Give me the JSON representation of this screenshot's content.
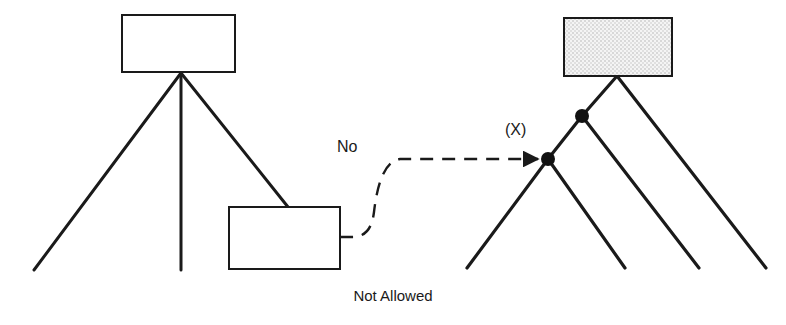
{
  "figure": {
    "caption": "Not Allowed",
    "labels": {
      "rejection": "No",
      "target_node": "(X)"
    },
    "colors": {
      "stroke": "#1a1a1a",
      "box_fill": "#ffffff",
      "stipple_fill": "#f2f2f2",
      "stipple_dot": "#b8b8b8",
      "node_fill": "#111111",
      "background": "#ffffff",
      "text": "#1a1a1a"
    },
    "left_structure": {
      "name": "box-hierarchy-not-allowed",
      "boxes": [
        {
          "id": "top-box",
          "x": 122,
          "y": 15,
          "width": 113,
          "height": 57,
          "fill": "plain"
        },
        {
          "id": "lower-box",
          "x": 229,
          "y": 207,
          "width": 111,
          "height": 62,
          "fill": "plain"
        }
      ],
      "junction": {
        "x": 181,
        "y": 73
      },
      "branches": [
        {
          "id": "left-branch",
          "from": [
            181,
            73
          ],
          "to": [
            34,
            270
          ]
        },
        {
          "id": "center-branch",
          "from": [
            181,
            73
          ],
          "to": [
            181,
            270
          ]
        },
        {
          "id": "right-branch-to-box",
          "from": [
            181,
            73
          ],
          "to": [
            288,
            207
          ]
        }
      ]
    },
    "right_structure": {
      "name": "node-tree-allowed",
      "boxes": [
        {
          "id": "stippled-box",
          "x": 564,
          "y": 18,
          "width": 108,
          "height": 58,
          "fill": "stipple"
        }
      ],
      "box_anchor": {
        "x": 617,
        "y": 76
      },
      "nodes": [
        {
          "id": "node-upper",
          "x": 582,
          "y": 116,
          "radius": 7
        },
        {
          "id": "node-lower-x",
          "x": 548,
          "y": 159,
          "radius": 7
        }
      ],
      "branches": [
        {
          "id": "box-to-node-upper",
          "from": [
            617,
            76
          ],
          "to": [
            582,
            116
          ]
        },
        {
          "id": "box-to-leaf-4",
          "from": [
            617,
            76
          ],
          "to": [
            766,
            268
          ]
        },
        {
          "id": "node-upper-to-node-lower",
          "from": [
            582,
            116
          ],
          "to": [
            548,
            159
          ]
        },
        {
          "id": "node-upper-to-leaf-3",
          "from": [
            582,
            116
          ],
          "to": [
            699,
            268
          ]
        },
        {
          "id": "node-lower-to-leaf-1",
          "from": [
            548,
            159
          ],
          "to": [
            467,
            268
          ]
        },
        {
          "id": "node-lower-to-leaf-2",
          "from": [
            548,
            159
          ],
          "to": [
            625,
            268
          ]
        }
      ]
    },
    "rejected_connection": {
      "name": "dashed-no-arrow",
      "style": "dashed",
      "from": [
        340,
        237
      ],
      "to": [
        545,
        159
      ],
      "arrowhead": true,
      "path": "M 340 237 L 352 237 C 366 237 372 228 374 212 C 377 186 384 161 400 159 L 542 159"
    }
  }
}
